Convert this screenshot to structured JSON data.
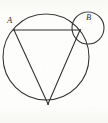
{
  "figure": {
    "background_color": "#fdfdfb",
    "stroke_color": "#2e2e2e",
    "width": 108,
    "height": 123,
    "labels": [
      {
        "text": "A",
        "x": 7,
        "y": 20,
        "point_x": 14,
        "point_y": 30
      },
      {
        "text": "B",
        "x": 86,
        "y": 16,
        "point_x": 80,
        "point_y": 30
      }
    ],
    "shapes": {
      "large_circle": {
        "cx": 46,
        "cy": 57,
        "r": 43
      },
      "small_circle": {
        "cx": 88,
        "cy": 28,
        "r": 16
      },
      "chord_AB": {
        "x1": 14,
        "y1": 30,
        "x2": 80,
        "y2": 30
      },
      "segment_A_to_vertex": {
        "x1": 14,
        "y1": 30,
        "x2": 48,
        "y2": 104
      },
      "segment_B_to_vertex": {
        "x1": 80,
        "y1": 30,
        "x2": 48,
        "y2": 104
      },
      "bottom_vertex": {
        "x": 48,
        "y": 104
      }
    }
  }
}
